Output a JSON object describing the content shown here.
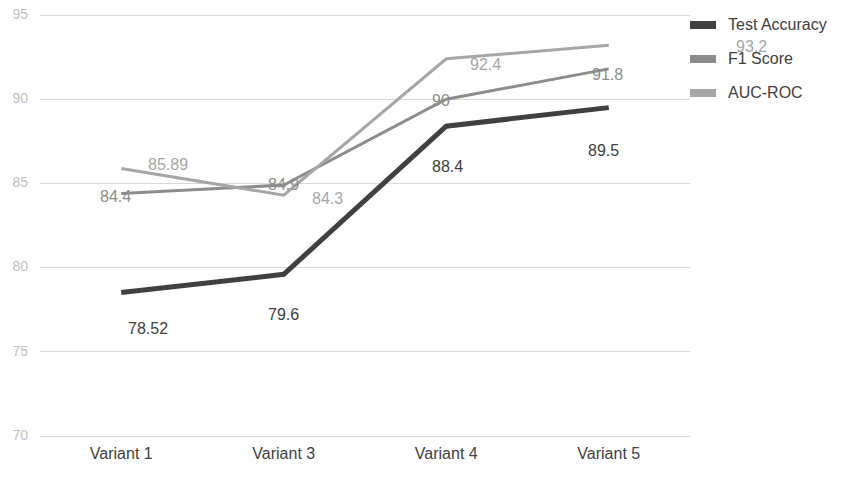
{
  "chart_data": {
    "type": "line",
    "title": "",
    "subtitle": "",
    "xlabel": "",
    "ylabel": "",
    "categories": [
      "Variant 1",
      "Variant 3",
      "Variant 4",
      "Variant 5"
    ],
    "ylim": [
      70,
      95
    ],
    "yticks": [
      70,
      75,
      80,
      85,
      90,
      95
    ],
    "grid": "horizontal",
    "legend_position": "top-right",
    "series": [
      {
        "name": "Test Accuracy",
        "color": "#404040",
        "line_width": 5,
        "values": [
          78.52,
          79.6,
          88.4,
          89.5
        ],
        "labels": [
          "78.52",
          "79.6",
          "88.4",
          "89.5"
        ]
      },
      {
        "name": "F1 Score",
        "color": "#8c8c8c",
        "line_width": 3,
        "values": [
          84.4,
          84.9,
          90,
          91.8
        ],
        "labels": [
          "84.4",
          "84.9",
          "90",
          "91.8"
        ]
      },
      {
        "name": "AUC-ROC",
        "color": "#a6a6a6",
        "line_width": 3,
        "values": [
          85.89,
          84.3,
          92.4,
          93.2
        ],
        "labels": [
          "85.89",
          "84.3",
          "92.4",
          "93.2"
        ]
      }
    ]
  },
  "axis": {
    "y_tick_labels": [
      "95",
      "90",
      "85",
      "80",
      "75",
      "70"
    ],
    "x_tick_labels": [
      "Variant 1",
      "Variant 3",
      "Variant 4",
      "Variant 5"
    ]
  },
  "legend": {
    "items": [
      {
        "label": "Test Accuracy",
        "color": "#404040"
      },
      {
        "label": "F1 Score",
        "color": "#8c8c8c"
      },
      {
        "label": "AUC-ROC",
        "color": "#a6a6a6"
      }
    ]
  },
  "data_labels": [
    {
      "text": "78.52",
      "x": 128,
      "y": 330,
      "anchor": "start",
      "tone": "dark"
    },
    {
      "text": "79.6",
      "x": 268,
      "y": 316,
      "anchor": "start",
      "tone": "dark"
    },
    {
      "text": "88.4",
      "x": 432,
      "y": 168,
      "anchor": "start",
      "tone": "dark"
    },
    {
      "text": "89.5",
      "x": 588,
      "y": 152,
      "anchor": "start",
      "tone": "dark"
    },
    {
      "text": "84.4",
      "x": 100,
      "y": 198,
      "anchor": "start",
      "tone": "mid"
    },
    {
      "text": "84.9",
      "x": 268,
      "y": 186,
      "anchor": "start",
      "tone": "mid"
    },
    {
      "text": "90",
      "x": 432,
      "y": 102,
      "anchor": "start",
      "tone": "mid"
    },
    {
      "text": "91.8",
      "x": 592,
      "y": 76,
      "anchor": "start",
      "tone": "mid"
    },
    {
      "text": "85.89",
      "x": 148,
      "y": 166,
      "anchor": "start",
      "tone": "light"
    },
    {
      "text": "84.3",
      "x": 312,
      "y": 200,
      "anchor": "start",
      "tone": "light"
    },
    {
      "text": "92.4",
      "x": 470,
      "y": 66,
      "anchor": "start",
      "tone": "light"
    },
    {
      "text": "93.2",
      "x": 736,
      "y": 48,
      "anchor": "start",
      "tone": "light"
    }
  ]
}
